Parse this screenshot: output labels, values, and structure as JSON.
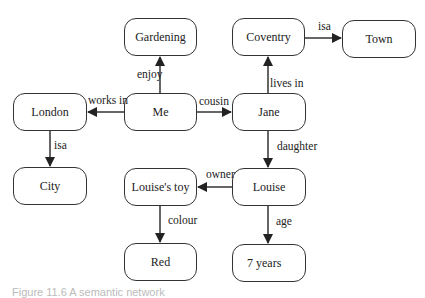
{
  "diagram": {
    "title": "Semantic network",
    "nodes": [
      {
        "id": "gardening",
        "label": "Gardening",
        "x": 124,
        "y": 18,
        "w": 73,
        "h": 38
      },
      {
        "id": "coventry",
        "label": "Coventry",
        "x": 232,
        "y": 18,
        "w": 73,
        "h": 38
      },
      {
        "id": "town",
        "label": "Town",
        "x": 342,
        "y": 20,
        "w": 74,
        "h": 38
      },
      {
        "id": "london",
        "label": "London",
        "x": 13,
        "y": 93,
        "w": 74,
        "h": 38
      },
      {
        "id": "me",
        "label": "Me",
        "x": 124,
        "y": 93,
        "w": 73,
        "h": 38
      },
      {
        "id": "jane",
        "label": "Jane",
        "x": 232,
        "y": 93,
        "w": 74,
        "h": 38
      },
      {
        "id": "city",
        "label": "City",
        "x": 13,
        "y": 167,
        "w": 74,
        "h": 38
      },
      {
        "id": "louises_toy",
        "label": "Louise's toy",
        "x": 124,
        "y": 168,
        "w": 73,
        "h": 38
      },
      {
        "id": "louise",
        "label": "Louise",
        "x": 232,
        "y": 168,
        "w": 74,
        "h": 38
      },
      {
        "id": "red",
        "label": "Red",
        "x": 124,
        "y": 243,
        "w": 73,
        "h": 38
      },
      {
        "id": "seven_years",
        "label": "7 years",
        "x": 232,
        "y": 244,
        "w": 74,
        "h": 38
      }
    ],
    "edges": [
      {
        "from": "me",
        "to": "gardening",
        "label": "enjoy"
      },
      {
        "from": "me",
        "to": "london",
        "label": "works in"
      },
      {
        "from": "me",
        "to": "jane",
        "label": "cousin"
      },
      {
        "from": "london",
        "to": "city",
        "label": "isa"
      },
      {
        "from": "jane",
        "to": "coventry",
        "label": "lives in"
      },
      {
        "from": "coventry",
        "to": "town",
        "label": "isa"
      },
      {
        "from": "jane",
        "to": "louise",
        "label": "daughter"
      },
      {
        "from": "louise",
        "to": "louises_toy",
        "label": "owner"
      },
      {
        "from": "louises_toy",
        "to": "red",
        "label": "colour"
      },
      {
        "from": "louise",
        "to": "seven_years",
        "label": "age"
      }
    ],
    "caption": "Figure 11.6  A semantic network"
  },
  "labels": {
    "gardening": "Gardening",
    "coventry": "Coventry",
    "town": "Town",
    "london": "London",
    "me": "Me",
    "jane": "Jane",
    "city": "City",
    "louises_toy": "Louise's toy",
    "louise": "Louise",
    "red": "Red",
    "seven_years": "7 years",
    "edge_enjoy": "enjoy",
    "edge_works_in": "works in",
    "edge_cousin": "cousin",
    "edge_isa_city": "isa",
    "edge_lives_in": "lives in",
    "edge_isa_town": "isa",
    "edge_daughter": "daughter",
    "edge_owner": "owner",
    "edge_colour": "colour",
    "edge_age": "age"
  }
}
